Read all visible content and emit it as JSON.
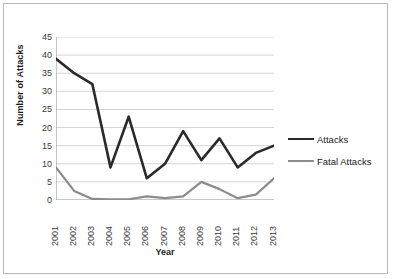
{
  "chart_data": {
    "type": "line",
    "title": "",
    "xlabel": "Year",
    "ylabel": "Number of Attacks",
    "categories": [
      "2001",
      "2002",
      "2003",
      "2004",
      "2005",
      "2006",
      "2007",
      "2008",
      "2009",
      "2010",
      "2011",
      "2012",
      "2013"
    ],
    "series": [
      {
        "name": "Attacks",
        "color": "#2a2a2a",
        "width": 2.6,
        "values": [
          39,
          35,
          32,
          9,
          23,
          6,
          10,
          19,
          11,
          17,
          9,
          13,
          15
        ]
      },
      {
        "name": "Fatal Attacks",
        "color": "#8c8c8c",
        "width": 2.2,
        "values": [
          9,
          2.5,
          0.3,
          0.2,
          0.2,
          1,
          0.5,
          1,
          5,
          3,
          0.5,
          1.5,
          6
        ]
      }
    ],
    "ylim": [
      0,
      45
    ],
    "yticks": [
      45,
      40,
      35,
      30,
      25,
      20,
      15,
      10,
      5,
      0
    ],
    "grid": "horizontal",
    "legend_position": "right",
    "axis_color": "#8f8f8f",
    "grid_color": "#c9c9c9",
    "background": "#ffffff"
  },
  "legend": {
    "entries": [
      {
        "label": "Attacks"
      },
      {
        "label": "Fatal Attacks"
      }
    ]
  }
}
